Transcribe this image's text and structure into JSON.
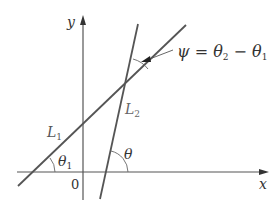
{
  "figure": {
    "axes": {
      "x_label": "x",
      "y_label": "y",
      "origin_label": "0"
    },
    "lines": [
      {
        "name": "L",
        "subscript": "1"
      },
      {
        "name": "L",
        "subscript": "2"
      }
    ],
    "angles": {
      "theta1": {
        "symbol": "θ",
        "subscript": "1"
      },
      "theta": {
        "symbol": "θ"
      }
    },
    "annotation": {
      "psi": "ψ",
      "equals": "=",
      "theta": "θ",
      "sub2": "2",
      "minus": "−",
      "sub1": "1"
    },
    "colors": {
      "line": "#555555",
      "text": "#333333"
    }
  }
}
